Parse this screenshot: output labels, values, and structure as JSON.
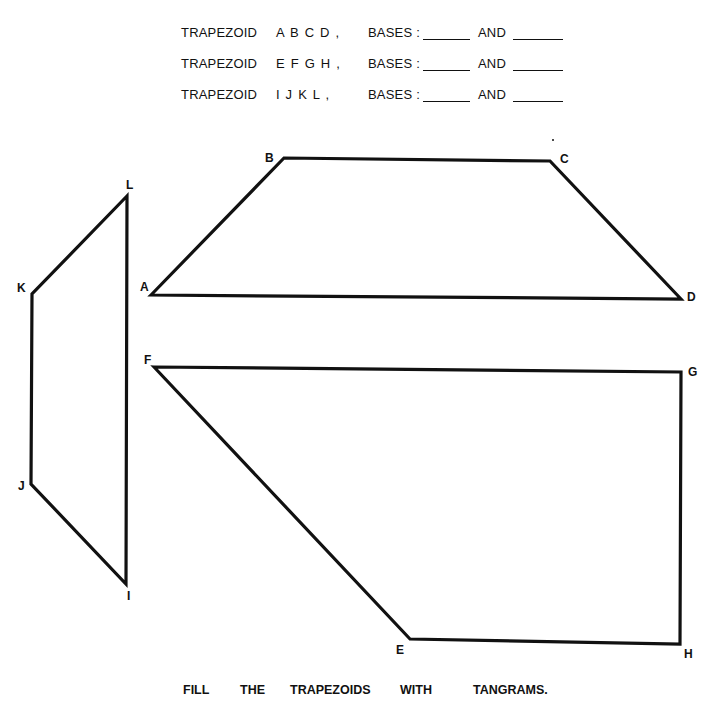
{
  "questions": [
    {
      "prefix": "TRAPEZOID",
      "letters": "A B C D ,",
      "bases_label": "BASES :",
      "and_label": "AND"
    },
    {
      "prefix": "TRAPEZOID",
      "letters": "E F G H ,",
      "bases_label": "BASES :",
      "and_label": "AND"
    },
    {
      "prefix": "TRAPEZOID",
      "letters": "I J K L ,",
      "bases_label": "BASES :",
      "and_label": "AND"
    }
  ],
  "instruction": {
    "words": [
      "FILL",
      "THE",
      "TRAPEZOIDS",
      "WITH",
      "TANGRAMS."
    ]
  },
  "shapes": {
    "abcd": {
      "labels": {
        "A": "A",
        "B": "B",
        "C": "C",
        "D": "D"
      }
    },
    "efgh": {
      "labels": {
        "E": "E",
        "F": "F",
        "G": "G",
        "H": "H"
      }
    },
    "ijkl": {
      "labels": {
        "I": "I",
        "J": "J",
        "K": "K",
        "L": "L"
      }
    }
  },
  "colors": {
    "ink": "#111111",
    "paper": "#ffffff"
  }
}
